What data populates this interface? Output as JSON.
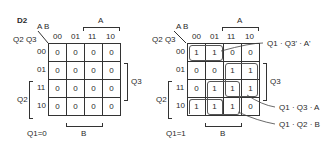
{
  "title": "D2",
  "axis_labels": {
    "columns": "A B",
    "rows": "Q2 Q3"
  },
  "column_codes": [
    "00",
    "01",
    "11",
    "10"
  ],
  "row_codes": [
    "00",
    "01",
    "11",
    "10"
  ],
  "range_labels": {
    "A": "A",
    "B": "B",
    "Q2": "Q2",
    "Q3": "Q3"
  },
  "maps": [
    {
      "caption": "Q1=0",
      "cells": [
        [
          "0",
          "0",
          "0",
          "0"
        ],
        [
          "0",
          "0",
          "0",
          "0"
        ],
        [
          "0",
          "0",
          "0",
          "0"
        ],
        [
          "0",
          "0",
          "0",
          "0"
        ]
      ]
    },
    {
      "caption": "Q1=1",
      "cells": [
        [
          "1",
          "1",
          "0",
          "0"
        ],
        [
          "0",
          "0",
          "1",
          "1"
        ],
        [
          "0",
          "1",
          "1",
          "1"
        ],
        [
          "1",
          "1",
          "1",
          "0"
        ]
      ],
      "groups": [
        {
          "label": "Q1 · Q3' · A'"
        },
        {
          "label": "Q1 · Q3 · A"
        },
        {
          "label": "Q1 · Q2 · B"
        }
      ]
    }
  ]
}
